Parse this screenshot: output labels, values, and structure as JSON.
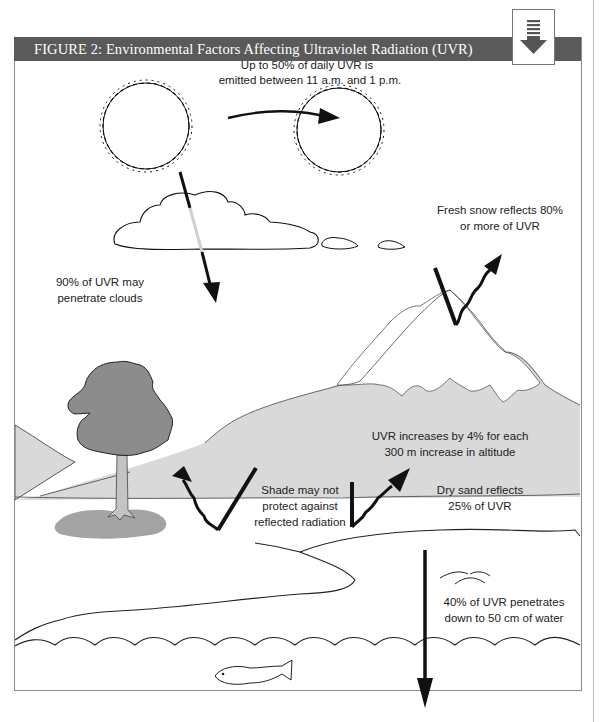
{
  "figure": {
    "title": "FIGURE 2:  Environmental Factors Affecting Ultraviolet Radiation (UVR)",
    "badge_icon": "download-arrow-icon",
    "colors": {
      "title_bar": "#5a5a5a",
      "mountain_fill": "#d9d9d9",
      "tree_fill": "#8c8c8c",
      "trunk_fill": "#c4c4c4",
      "shadow_fill": "#a3a3a3",
      "arrow": "#111111"
    }
  },
  "labels": {
    "sun_line1": "Up to 50% of daily UVR is",
    "sun_line2": "emitted between 11 a.m. and 1 p.m.",
    "snow_line1": "Fresh snow reflects 80%",
    "snow_line2": "or more of UVR",
    "clouds_line1": "90% of UVR may",
    "clouds_line2": "penetrate clouds",
    "altitude_line1": "UVR increases by 4% for each",
    "altitude_line2": "300 m increase in altitude",
    "shade_line1": "Shade may not",
    "shade_line2": "protect against",
    "shade_line3": "reflected radiation",
    "sand_line1": "Dry sand reflects",
    "sand_line2": "25% of UVR",
    "water_line1": "40% of UVR penetrates",
    "water_line2": "down to 50 cm of water"
  }
}
